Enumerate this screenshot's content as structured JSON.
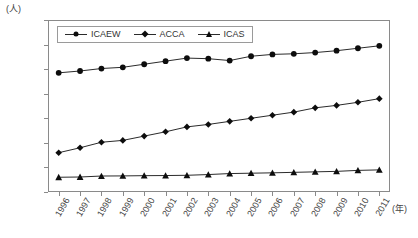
{
  "chart_data": {
    "type": "line",
    "title": "",
    "unit_label": "(人)",
    "xlabel": "(年)",
    "ylabel": "",
    "grid": false,
    "legend_position": "top-left-inside",
    "categories": [
      "1996",
      "1997",
      "1998",
      "1999",
      "2000",
      "2001",
      "2002",
      "2003",
      "2004",
      "2005",
      "2006",
      "2007",
      "2008",
      "2009",
      "2010",
      "2011"
    ],
    "ylim": [
      0,
      140000
    ],
    "yticks": [
      0,
      20000,
      40000,
      60000,
      80000,
      100000,
      120000,
      140000
    ],
    "ytick_labels": [
      "0",
      "20000",
      "40000",
      "60000",
      "80000",
      "100000",
      "120000",
      "140000"
    ],
    "series": [
      {
        "name": "ICAEW",
        "marker": "circle",
        "color": "#0d0d0d",
        "values": [
          97000,
          98500,
          100500,
          101500,
          104000,
          106500,
          109000,
          108500,
          107000,
          110500,
          112000,
          112500,
          113500,
          115000,
          117000,
          119000
        ]
      },
      {
        "name": "ACCA",
        "marker": "diamond",
        "color": "#0d0d0d",
        "values": [
          32000,
          36000,
          40500,
          42000,
          45500,
          49000,
          53000,
          55000,
          57500,
          60000,
          62500,
          65000,
          68500,
          70500,
          73000,
          76000
        ]
      },
      {
        "name": "ICAS",
        "marker": "triangle",
        "color": "#0d0d0d",
        "values": [
          12000,
          12200,
          13000,
          13100,
          13300,
          13400,
          13600,
          14200,
          15000,
          15300,
          15600,
          16000,
          16400,
          16800,
          17600,
          18000
        ]
      }
    ]
  },
  "legend": {
    "items": [
      {
        "label": "ICAEW",
        "marker": "circle"
      },
      {
        "label": "ACCA",
        "marker": "diamond"
      },
      {
        "label": "ICAS",
        "marker": "triangle"
      }
    ]
  },
  "axis": {
    "y_unit": "(人)",
    "x_unit": "(年)"
  },
  "colors": {
    "line": "#2b2b2b",
    "marker": "#0d0d0d",
    "frame": "#8a8a8a",
    "text": "#444444",
    "background": "#ffffff"
  }
}
